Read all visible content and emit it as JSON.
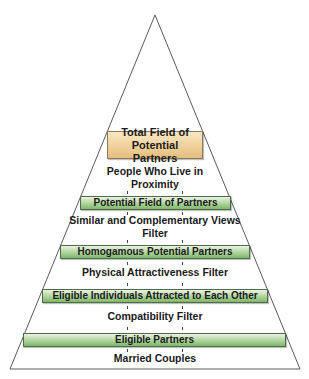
{
  "diagram": {
    "type": "pyramid",
    "colors": {
      "outline": "#5a5a5a",
      "top_box": "#efcf98",
      "filter_box": "#a6cc93",
      "text": "#1a1a1a"
    },
    "top_box": {
      "line1": "Total Field of",
      "line2": "Potential Partners"
    },
    "stages": [
      {
        "filter_line1": "People Who Live in",
        "filter_line2": "Proximity",
        "result": "Potential Field of Partners"
      },
      {
        "filter_line1": "Similar and Complementary Views",
        "filter_line2": "Filter",
        "result": "Homogamous Potential Partners"
      },
      {
        "filter_line1": "Physical Attractiveness Filter",
        "filter_line2": "",
        "result": "Eligible Individuals Attracted to Each Other"
      },
      {
        "filter_line1": "Compatibility Filter",
        "filter_line2": "",
        "result": "Eligible Partners"
      }
    ],
    "bottom_label": "Married Couples"
  }
}
